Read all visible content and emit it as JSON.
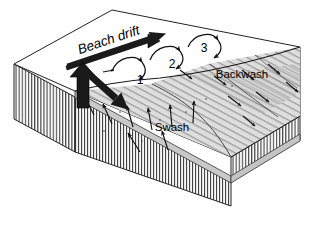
{
  "figure": {
    "type": "block-diagram",
    "background_color": "#ffffff",
    "line_color": "#000000"
  },
  "labels": {
    "beach_drift": "Beach drift",
    "swash": "Swash",
    "backwash": "Backwash",
    "step_1": "1",
    "step_2": "2",
    "step_3": "3"
  },
  "colors": {
    "sea_surface": "#ffffff",
    "beach_surface": "#d8d8d8",
    "block_side": "#f2f2f2",
    "block_front": "#e8e8e8",
    "arrow_fill": "#1a1a1a",
    "hatch_line": "#3a3a3a"
  },
  "arrows": {
    "beach_drift_arrow": "thick-arrow-up-right",
    "swash_arrow": "thick-arrow-up",
    "backwash_arrow": "thick-arrow-down-right"
  },
  "icons": {
    "swash_marker": "small-arrow-up-icon",
    "backwash_marker": "small-arrow-down-right-icon",
    "loop_path": "curved-loop-arrow-icon"
  }
}
